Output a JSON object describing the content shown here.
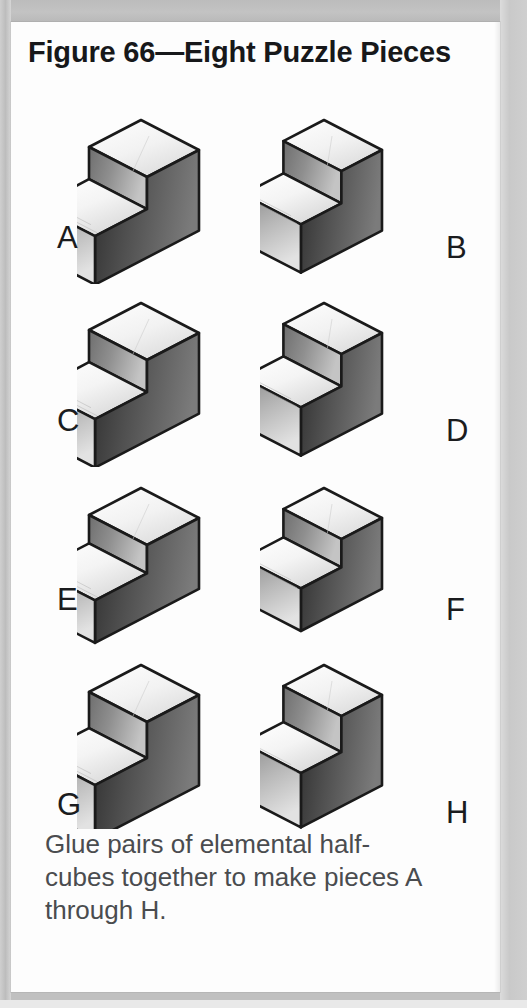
{
  "figure": {
    "title": "Figure 66—Eight Puzzle Pieces",
    "caption": "Glue pairs of elemental half-cubes together to make pieces A through H.",
    "caption_lines": [
      "Glue pairs of elemental half-",
      "cubes together to make pieces A",
      "through H."
    ]
  },
  "colors": {
    "page_background": "#fdfdfd",
    "scan_background": "#c0c0c0",
    "title_text": "#17181a",
    "label_text": "#1b1c1e",
    "caption_text": "#4a4c4f",
    "outline": "#1a1a1a",
    "face_top_light": "#f2f2f2",
    "face_top_mid": "#dcdcdc",
    "face_left_mid": "#c9c9c9",
    "face_right_dark": "#4f4f4f"
  },
  "pieces": [
    {
      "label": "A",
      "label_side": "left",
      "shape": "step-block",
      "riser_ratio": 0.5,
      "depth_ratio": 1.0
    },
    {
      "label": "B",
      "label_side": "right",
      "shape": "step-block",
      "riser_ratio": 0.5,
      "depth_ratio": 0.78
    },
    {
      "label": "C",
      "label_side": "left",
      "shape": "step-block",
      "riser_ratio": 0.5,
      "depth_ratio": 1.0
    },
    {
      "label": "D",
      "label_side": "right",
      "shape": "step-block",
      "riser_ratio": 0.5,
      "depth_ratio": 0.78
    },
    {
      "label": "E",
      "label_side": "left",
      "shape": "step-block",
      "riser_ratio": 0.44,
      "depth_ratio": 1.0
    },
    {
      "label": "F",
      "label_side": "right",
      "shape": "step-block",
      "riser_ratio": 0.44,
      "depth_ratio": 0.78
    },
    {
      "label": "G",
      "label_side": "left",
      "shape": "step-block",
      "riser_ratio": 0.56,
      "depth_ratio": 1.0
    },
    {
      "label": "H",
      "label_side": "right",
      "shape": "step-block",
      "riser_ratio": 0.56,
      "depth_ratio": 0.78
    }
  ],
  "icons": {
    "piece": "isometric-step-block-icon"
  }
}
